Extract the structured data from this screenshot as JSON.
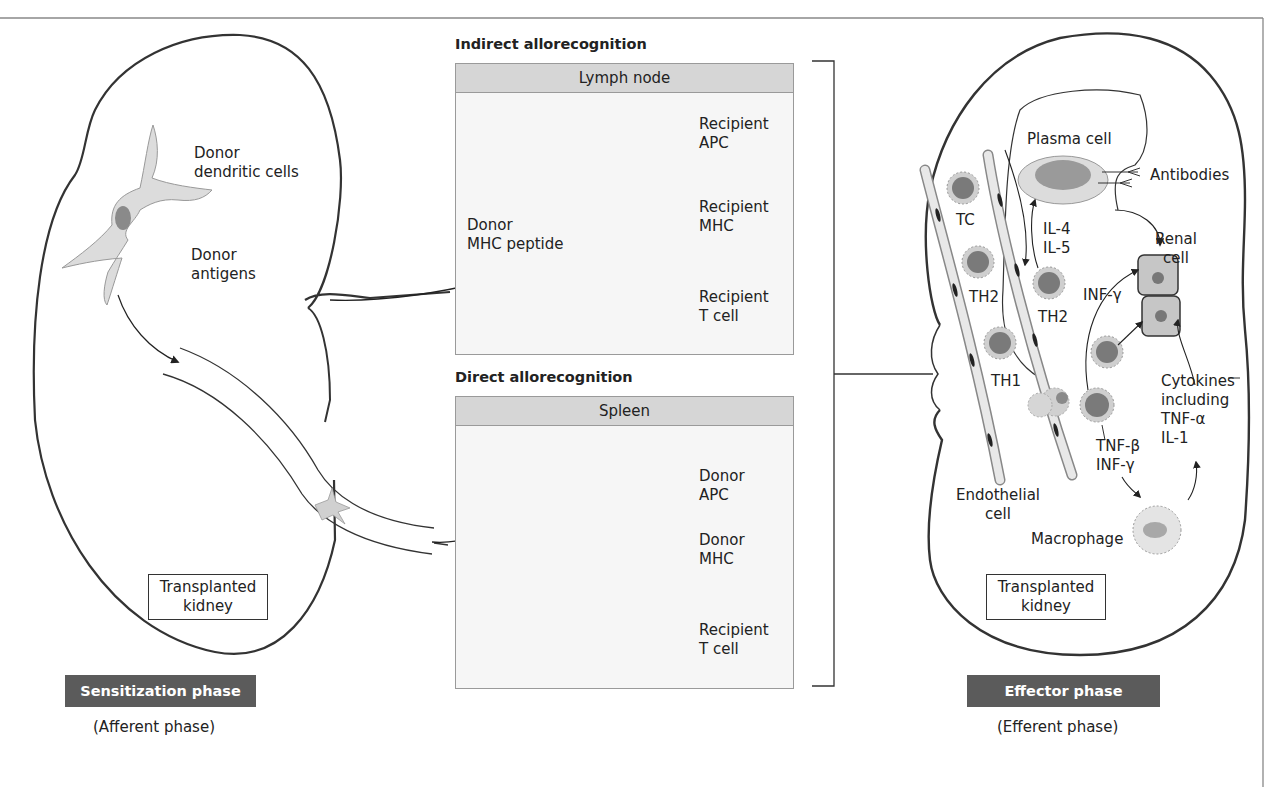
{
  "diagram": {
    "title_left_phase": "Sensitization phase",
    "subtitle_left_phase": "(Afferent phase)",
    "title_right_phase": "Effector phase",
    "subtitle_right_phase": "(Efferent phase)",
    "left_kidney": {
      "box_label_line1": "Transplanted",
      "box_label_line2": "kidney",
      "dendritic_label_line1": "Donor",
      "dendritic_label_line2": "dendritic cells",
      "antigens_label_line1": "Donor",
      "antigens_label_line2": "antigens"
    },
    "indirect": {
      "heading": "Indirect allorecognition",
      "panel_title": "Lymph node",
      "apc_label_line1": "Recipient",
      "apc_label_line2": "APC",
      "mhc_label_line1": "Recipient",
      "mhc_label_line2": "MHC",
      "peptide_label_line1": "Donor",
      "peptide_label_line2": "MHC peptide",
      "tcell_label_line1": "Recipient",
      "tcell_label_line2": "T cell"
    },
    "direct": {
      "heading": "Direct allorecognition",
      "panel_title": "Spleen",
      "apc_label_line1": "Donor",
      "apc_label_line2": "APC",
      "mhc_label_line1": "Donor",
      "mhc_label_line2": "MHC",
      "tcell_label_line1": "Recipient",
      "tcell_label_line2": "T cell"
    },
    "right_kidney": {
      "box_label_line1": "Transplanted",
      "box_label_line2": "kidney",
      "plasma_cell": "Plasma cell",
      "antibodies": "Antibodies",
      "renal_cell_line1": "Renal",
      "renal_cell_line2": "cell",
      "tc": "TC",
      "th2_left": "TH2",
      "th2_right": "TH2",
      "th1": "TH1",
      "il4": "IL-4",
      "il5": "IL-5",
      "inf_gamma_top": "INF-γ",
      "cytokines_line1": "Cytokines",
      "cytokines_line2": "including",
      "cytokines_line3": "TNF-α",
      "cytokines_line4": "IL-1",
      "tnf_beta": "TNF-β",
      "inf_gamma_bottom": "INF-γ",
      "endothelial_line1": "Endothelial",
      "endothelial_line2": "cell",
      "macrophage": "Macrophage"
    },
    "colors": {
      "cell_fill": "#dcdcdc",
      "nucleus": "#8a8a8a",
      "panel_bg": "#f6f6f6",
      "panel_header": "#d6d6d6",
      "phase_bar": "#5b5b5b",
      "outline": "#333333"
    }
  }
}
